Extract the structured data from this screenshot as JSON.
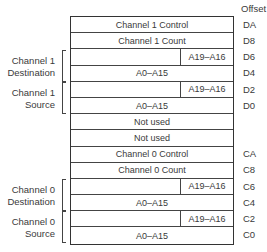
{
  "header": {
    "offset_label": "Offset"
  },
  "rows": [
    {
      "type": "full",
      "text": "Channel 1 Control",
      "offset": "DA"
    },
    {
      "type": "full",
      "text": "Channel 1 Count",
      "offset": "D8"
    },
    {
      "type": "split",
      "left": "",
      "right": "A19–A16",
      "offset": "D6"
    },
    {
      "type": "full",
      "text": "A0–A15",
      "offset": "D4"
    },
    {
      "type": "split",
      "left": "",
      "right": "A19–A16",
      "offset": "D2"
    },
    {
      "type": "full",
      "text": "A0–A15",
      "offset": "D0"
    },
    {
      "type": "full",
      "text": "Not used",
      "offset": ""
    },
    {
      "type": "full",
      "text": "Not used",
      "offset": ""
    },
    {
      "type": "full",
      "text": "Channel 0 Control",
      "offset": "CA"
    },
    {
      "type": "full",
      "text": "Channel 0 Count",
      "offset": "C8"
    },
    {
      "type": "split",
      "left": "",
      "right": "A19–A16",
      "offset": "C6"
    },
    {
      "type": "full",
      "text": "A0–A15",
      "offset": "C4"
    },
    {
      "type": "split",
      "left": "",
      "right": "A19–A16",
      "offset": "C2"
    },
    {
      "type": "full",
      "text": "A0–A15",
      "offset": "C0"
    }
  ],
  "groups": [
    {
      "line1": "Channel 1",
      "line2": "Destination",
      "start_row": 2
    },
    {
      "line1": "Channel 1",
      "line2": "Source",
      "start_row": 4
    },
    {
      "line1": "Channel 0",
      "line2": "Destination",
      "start_row": 10
    },
    {
      "line1": "Channel 0",
      "line2": "Source",
      "start_row": 12
    }
  ]
}
